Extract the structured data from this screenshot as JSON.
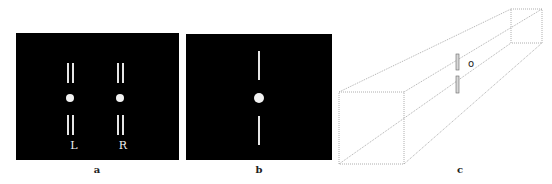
{
  "panels": {
    "a": {
      "caption": "a",
      "labels": {
        "left": "L",
        "right": "R"
      }
    },
    "b": {
      "caption": "b"
    },
    "c": {
      "caption": "c",
      "annotation": "o"
    }
  },
  "colors": {
    "panel_bg": "#000000",
    "stimulus": "#e6e6e6",
    "box_line": "#9a9a9a",
    "background": "#ffffff"
  }
}
